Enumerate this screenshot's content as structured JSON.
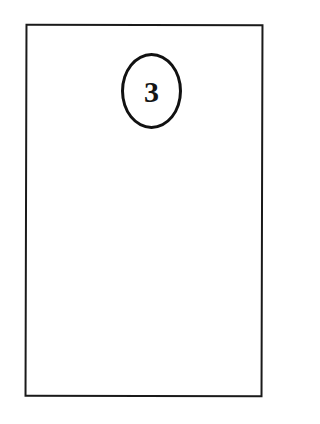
{
  "page": {
    "number_badge": {
      "label": "3"
    }
  },
  "colors": {
    "background": "#ffffff",
    "ink": "#151515"
  }
}
